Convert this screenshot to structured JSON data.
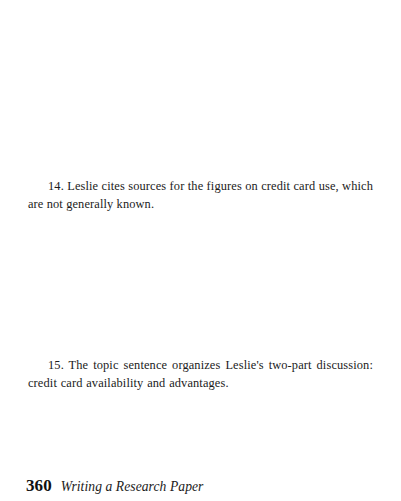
{
  "page": {
    "background_color": "#ffffff",
    "text_color": "#1b1b1b",
    "folio_color": "#111111"
  },
  "body": {
    "notes": [
      {
        "number": "14.",
        "text": "14. Leslie cites sources for the figures on credit card use, which are not generally known."
      },
      {
        "number": "15.",
        "text": "15. The topic sentence organizes Leslie's two-part discussion: credit card availability and advantages."
      }
    ]
  },
  "footer": {
    "page_number": "360",
    "running_head": "Writing a Research Paper"
  }
}
